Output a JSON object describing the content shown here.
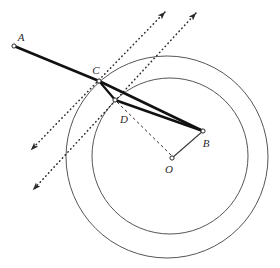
{
  "figure": {
    "background_color": "#ffffff",
    "stroke_color": "#3a3a3a",
    "bold_stroke_color": "#111111",
    "width": 280,
    "height": 268
  },
  "circles": [
    {
      "name": "outer-circle",
      "cx": 167,
      "cy": 157,
      "r": 101,
      "stroke": "#555555",
      "stroke_width": 1
    },
    {
      "name": "inner-circle",
      "cx": 170,
      "cy": 156,
      "r": 78,
      "stroke": "#555555",
      "stroke_width": 1
    }
  ],
  "points": [
    {
      "id": "A",
      "label": "A",
      "x": 14,
      "y": 46,
      "label_x": 21,
      "label_y": 41
    },
    {
      "id": "C",
      "label": "C",
      "x": 99,
      "y": 81,
      "label_x": 96,
      "label_y": 74
    },
    {
      "id": "D",
      "label": "D",
      "x": 115,
      "y": 100,
      "label_x": 124,
      "label_y": 123
    },
    {
      "id": "B",
      "label": "B",
      "x": 203,
      "y": 131,
      "label_x": 206,
      "label_y": 147
    },
    {
      "id": "O",
      "label": "O",
      "x": 172,
      "y": 158,
      "label_x": 169,
      "label_y": 173
    }
  ],
  "solid_segments": [
    {
      "name": "segment-A-C",
      "from": "A",
      "to": "C",
      "x1": 14,
      "y1": 46,
      "x2": 99,
      "y2": 81,
      "width": 2.6
    },
    {
      "name": "segment-C-B",
      "from": "C",
      "to": "B",
      "x1": 99,
      "y1": 81,
      "x2": 203,
      "y2": 131,
      "width": 2.6
    },
    {
      "name": "segment-D-B",
      "from": "D",
      "to": "B",
      "x1": 115,
      "y1": 100,
      "x2": 203,
      "y2": 131,
      "width": 2.6
    },
    {
      "name": "segment-C-D",
      "from": "C",
      "to": "D",
      "x1": 99,
      "y1": 81,
      "x2": 115,
      "y2": 100,
      "width": 2.2
    },
    {
      "name": "segment-B-O",
      "from": "B",
      "to": "O",
      "x1": 203,
      "y1": 131,
      "x2": 172,
      "y2": 158,
      "width": 1.1
    }
  ],
  "dotted_rays": [
    {
      "name": "normal-ray-through-C",
      "through_point": "C",
      "tail_x": 31,
      "tail_y": 150,
      "head_x": 165,
      "head_y": 12,
      "arrow_at_both_ends": true
    },
    {
      "name": "normal-ray-through-D",
      "through_point": "D",
      "tail_x": 33,
      "tail_y": 190,
      "head_x": 196,
      "head_y": 13,
      "arrow_at_both_ends": true
    }
  ],
  "dashed_segments": [
    {
      "name": "dashed-segment-D-O",
      "from": "D",
      "to": "O",
      "x1": 117,
      "y1": 102,
      "x2": 172,
      "y2": 156
    }
  ]
}
